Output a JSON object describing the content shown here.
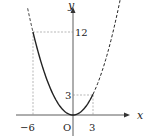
{
  "diagram": {
    "function": "y = x^2/3",
    "axes": {
      "x_label": "x",
      "y_label": "y",
      "origin_label": "O"
    },
    "ticks": {
      "x": [
        "−6",
        "3"
      ],
      "y": [
        "12",
        "3"
      ]
    },
    "points": [
      {
        "x": -6,
        "y": 12
      },
      {
        "x": 3,
        "y": 3
      }
    ],
    "solid_range": [
      -6,
      3
    ],
    "dashed_outside": true,
    "colors": {
      "curve": "#222222",
      "guide": "#888888",
      "axis": "#333333"
    }
  }
}
